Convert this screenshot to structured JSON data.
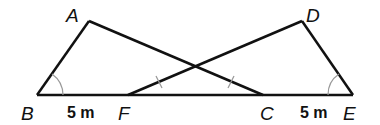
{
  "diagram": {
    "stroke_color": "#111111",
    "arc_color": "#999999",
    "points": {
      "A": {
        "label": "A",
        "x": 89,
        "y": 21
      },
      "B": {
        "label": "B",
        "x": 37,
        "y": 95
      },
      "F": {
        "label": "F",
        "x": 128,
        "y": 95
      },
      "C": {
        "label": "C",
        "x": 263,
        "y": 95
      },
      "E": {
        "label": "E",
        "x": 353,
        "y": 95
      },
      "D": {
        "label": "D",
        "x": 302,
        "y": 21
      }
    },
    "segments": [
      "AB",
      "AC",
      "BE",
      "FD",
      "DE"
    ],
    "measurements": {
      "BF": "5 m",
      "CE": "5 m"
    },
    "angle_marks": [
      "B",
      "E"
    ],
    "congruence_ticks": [
      "AC",
      "FD"
    ]
  }
}
